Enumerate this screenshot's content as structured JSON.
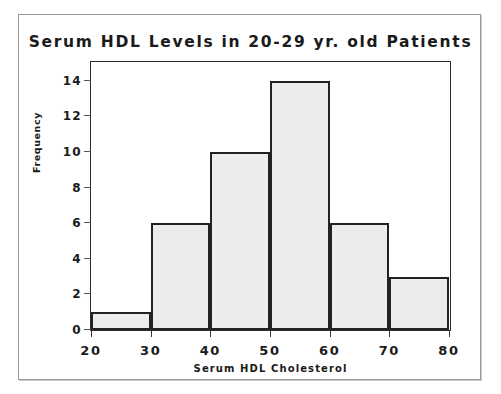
{
  "chart_data": {
    "type": "bar",
    "title": "Serum HDL Levels in 20-29 yr. old Patients",
    "xlabel": "Serum HDL Cholesterol",
    "ylabel": "Frequency",
    "categories": [
      "20-30",
      "30-40",
      "40-50",
      "50-60",
      "60-70",
      "70-80"
    ],
    "bin_edges": [
      20,
      30,
      40,
      50,
      60,
      70,
      80
    ],
    "values": [
      1,
      6,
      10,
      14,
      6,
      3
    ],
    "xlim": [
      20,
      80
    ],
    "ylim": [
      0,
      15
    ],
    "x_ticks": [
      "20",
      "30",
      "40",
      "50",
      "60",
      "70",
      "80"
    ],
    "x_tick_values": [
      20,
      30,
      40,
      50,
      60,
      70,
      80
    ],
    "y_ticks": [
      "0",
      "2",
      "4",
      "6",
      "8",
      "10",
      "12",
      "14"
    ],
    "y_tick_values": [
      0,
      2,
      4,
      6,
      8,
      10,
      12,
      14
    ],
    "grid": false,
    "legend": false,
    "bar_fill_color": "#ececec",
    "bar_edge_color": "#222222",
    "axis_color": "#2b2b2b",
    "text_color": "#1a1a1a",
    "background_color": "#ffffff"
  }
}
